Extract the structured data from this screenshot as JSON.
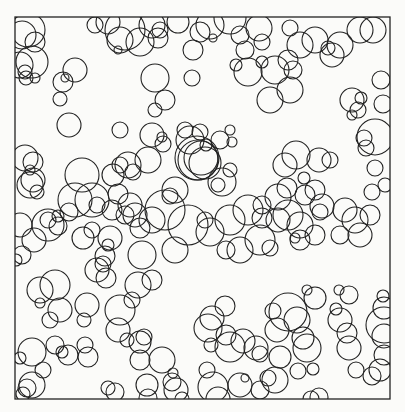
{
  "figure": {
    "frame": {
      "x": 15,
      "y": 17,
      "w": 375,
      "h": 382
    },
    "stroke_color": "#222222",
    "background": "#fbfbf9",
    "circles": [
      [
        22,
        35,
        14
      ],
      [
        28,
        30,
        17
      ],
      [
        35,
        42,
        10
      ],
      [
        20,
        65,
        13
      ],
      [
        32,
        62,
        16
      ],
      [
        26,
        78,
        7
      ],
      [
        35,
        78,
        5
      ],
      [
        95,
        25,
        8
      ],
      [
        108,
        22,
        12
      ],
      [
        125,
        30,
        20
      ],
      [
        120,
        40,
        13
      ],
      [
        118,
        50,
        4
      ],
      [
        140,
        42,
        14
      ],
      [
        158,
        38,
        10
      ],
      [
        152,
        25,
        13
      ],
      [
        160,
        30,
        8
      ],
      [
        178,
        22,
        11
      ],
      [
        200,
        32,
        10
      ],
      [
        193,
        50,
        10
      ],
      [
        155,
        78,
        14
      ],
      [
        165,
        100,
        10
      ],
      [
        75,
        70,
        12
      ],
      [
        63,
        82,
        10
      ],
      [
        65,
        78,
        4
      ],
      [
        60,
        99,
        7
      ],
      [
        25,
        72,
        7
      ],
      [
        33,
        180,
        12
      ],
      [
        25,
        158,
        13
      ],
      [
        33,
        162,
        10
      ],
      [
        30,
        185,
        13
      ],
      [
        37,
        192,
        7
      ],
      [
        30,
        170,
        5
      ],
      [
        69,
        125,
        12
      ],
      [
        155,
        110,
        7
      ],
      [
        192,
        78,
        8
      ],
      [
        213,
        38,
        4
      ],
      [
        210,
        25,
        14
      ],
      [
        230,
        18,
        16
      ],
      [
        240,
        35,
        9
      ],
      [
        259,
        28,
        13
      ],
      [
        245,
        50,
        9
      ],
      [
        262,
        42,
        8
      ],
      [
        236,
        65,
        6
      ],
      [
        248,
        72,
        14
      ],
      [
        262,
        62,
        6
      ],
      [
        275,
        70,
        14
      ],
      [
        290,
        90,
        13
      ],
      [
        270,
        100,
        13
      ],
      [
        293,
        70,
        9
      ],
      [
        288,
        60,
        10
      ],
      [
        290,
        28,
        8
      ],
      [
        300,
        45,
        13
      ],
      [
        315,
        40,
        13
      ],
      [
        328,
        48,
        7
      ],
      [
        340,
        45,
        13
      ],
      [
        332,
        55,
        12
      ],
      [
        360,
        30,
        13
      ],
      [
        373,
        30,
        13
      ],
      [
        381,
        80,
        9
      ],
      [
        352,
        100,
        12
      ],
      [
        358,
        110,
        8
      ],
      [
        361,
        98,
        6
      ],
      [
        352,
        115,
        5
      ],
      [
        383,
        104,
        9
      ],
      [
        375,
        137,
        18
      ],
      [
        364,
        138,
        8
      ],
      [
        366,
        148,
        8
      ],
      [
        375,
        168,
        8
      ],
      [
        330,
        160,
        8
      ],
      [
        319,
        160,
        12
      ],
      [
        296,
        155,
        14
      ],
      [
        285,
        165,
        12
      ],
      [
        304,
        178,
        6
      ],
      [
        305,
        195,
        10
      ],
      [
        287,
        188,
        10
      ],
      [
        278,
        197,
        13
      ],
      [
        278,
        220,
        12
      ],
      [
        288,
        215,
        15
      ],
      [
        315,
        190,
        10
      ],
      [
        322,
        206,
        12
      ],
      [
        320,
        212,
        8
      ],
      [
        345,
        210,
        12
      ],
      [
        355,
        220,
        13
      ],
      [
        370,
        215,
        10
      ],
      [
        385,
        185,
        7
      ],
      [
        372,
        192,
        8
      ],
      [
        300,
        225,
        13
      ],
      [
        315,
        235,
        10
      ],
      [
        300,
        240,
        10
      ],
      [
        295,
        238,
        5
      ],
      [
        340,
        235,
        9
      ],
      [
        360,
        235,
        12
      ],
      [
        230,
        220,
        15
      ],
      [
        248,
        210,
        15
      ],
      [
        262,
        205,
        9
      ],
      [
        262,
        218,
        10
      ],
      [
        260,
        240,
        15
      ],
      [
        270,
        248,
        8
      ],
      [
        240,
        250,
        13
      ],
      [
        226,
        250,
        9
      ],
      [
        197,
        158,
        22
      ],
      [
        198,
        160,
        20
      ],
      [
        205,
        163,
        16
      ],
      [
        201,
        158,
        17
      ],
      [
        190,
        140,
        14
      ],
      [
        220,
        140,
        9
      ],
      [
        232,
        142,
        5
      ],
      [
        230,
        130,
        5
      ],
      [
        206,
        145,
        6
      ],
      [
        185,
        130,
        8
      ],
      [
        200,
        132,
        8
      ],
      [
        218,
        185,
        7
      ],
      [
        230,
        170,
        7
      ],
      [
        222,
        182,
        14
      ],
      [
        175,
        190,
        13
      ],
      [
        170,
        196,
        8
      ],
      [
        165,
        210,
        20
      ],
      [
        152,
        220,
        13
      ],
      [
        130,
        205,
        12
      ],
      [
        125,
        215,
        9
      ],
      [
        135,
        215,
        12
      ],
      [
        140,
        228,
        10
      ],
      [
        142,
        255,
        14
      ],
      [
        152,
        280,
        10
      ],
      [
        112,
        210,
        10
      ],
      [
        110,
        238,
        12
      ],
      [
        108,
        245,
        6
      ],
      [
        105,
        256,
        10
      ],
      [
        103,
        264,
        8
      ],
      [
        97,
        270,
        12
      ],
      [
        92,
        200,
        17
      ],
      [
        75,
        200,
        17
      ],
      [
        69,
        212,
        9
      ],
      [
        58,
        226,
        9
      ],
      [
        58,
        216,
        6
      ],
      [
        48,
        225,
        16
      ],
      [
        48,
        220,
        8
      ],
      [
        34,
        240,
        12
      ],
      [
        20,
        225,
        12
      ],
      [
        16,
        260,
        6
      ],
      [
        22,
        255,
        9
      ],
      [
        40,
        290,
        13
      ],
      [
        83,
        238,
        11
      ],
      [
        92,
        230,
        8
      ],
      [
        97,
        205,
        8
      ],
      [
        82,
        175,
        17
      ],
      [
        113,
        175,
        11
      ],
      [
        120,
        165,
        8
      ],
      [
        128,
        165,
        13
      ],
      [
        133,
        172,
        8
      ],
      [
        148,
        160,
        13
      ],
      [
        118,
        194,
        10
      ],
      [
        162,
        137,
        5
      ],
      [
        163,
        144,
        8
      ],
      [
        120,
        130,
        8
      ],
      [
        152,
        135,
        12
      ],
      [
        175,
        250,
        13
      ],
      [
        188,
        225,
        20
      ],
      [
        205,
        220,
        8
      ],
      [
        210,
        232,
        14
      ],
      [
        132,
        300,
        8
      ],
      [
        138,
        285,
        13
      ],
      [
        212,
        318,
        12
      ],
      [
        225,
        306,
        10
      ],
      [
        226,
        335,
        10
      ],
      [
        230,
        347,
        15
      ],
      [
        208,
        328,
        14
      ],
      [
        211,
        345,
        7
      ],
      [
        243,
        341,
        12
      ],
      [
        256,
        348,
        12
      ],
      [
        273,
        311,
        8
      ],
      [
        277,
        330,
        12
      ],
      [
        260,
        354,
        8
      ],
      [
        280,
        357,
        11
      ],
      [
        268,
        378,
        8
      ],
      [
        275,
        380,
        13
      ],
      [
        240,
        385,
        12
      ],
      [
        245,
        378,
        4
      ],
      [
        213,
        387,
        15
      ],
      [
        207,
        370,
        8
      ],
      [
        172,
        382,
        9
      ],
      [
        176,
        390,
        12
      ],
      [
        173,
        373,
        5
      ],
      [
        147,
        385,
        11
      ],
      [
        140,
        360,
        10
      ],
      [
        162,
        360,
        13
      ],
      [
        140,
        342,
        11
      ],
      [
        144,
        337,
        8
      ],
      [
        120,
        310,
        15
      ],
      [
        118,
        330,
        12
      ],
      [
        127,
        340,
        7
      ],
      [
        87,
        305,
        12
      ],
      [
        84,
        320,
        7
      ],
      [
        106,
        278,
        10
      ],
      [
        55,
        285,
        15
      ],
      [
        60,
        310,
        12
      ],
      [
        50,
        320,
        8
      ],
      [
        40,
        303,
        5
      ],
      [
        32,
        352,
        14
      ],
      [
        20,
        358,
        6
      ],
      [
        55,
        345,
        9
      ],
      [
        68,
        355,
        10
      ],
      [
        62,
        352,
        6
      ],
      [
        85,
        345,
        8
      ],
      [
        88,
        357,
        10
      ],
      [
        43,
        370,
        8
      ],
      [
        32,
        385,
        13
      ],
      [
        27,
        388,
        9
      ],
      [
        23,
        394,
        7
      ],
      [
        108,
        388,
        7
      ],
      [
        115,
        392,
        9
      ],
      [
        148,
        398,
        9
      ],
      [
        182,
        399,
        7
      ],
      [
        218,
        399,
        12
      ],
      [
        260,
        390,
        9
      ],
      [
        288,
        312,
        19
      ],
      [
        297,
        320,
        13
      ],
      [
        303,
        338,
        11
      ],
      [
        307,
        348,
        14
      ],
      [
        336,
        309,
        6
      ],
      [
        340,
        320,
        12
      ],
      [
        347,
        333,
        10
      ],
      [
        349,
        348,
        12
      ],
      [
        356,
        370,
        8
      ],
      [
        298,
        371,
        8
      ],
      [
        313,
        369,
        6
      ],
      [
        311,
        399,
        8
      ],
      [
        319,
        397,
        9
      ],
      [
        315,
        298,
        11
      ],
      [
        307,
        290,
        5
      ],
      [
        349,
        295,
        9
      ],
      [
        339,
        290,
        5
      ],
      [
        383,
        296,
        6
      ],
      [
        384,
        308,
        11
      ],
      [
        384,
        325,
        18
      ],
      [
        384,
        336,
        12
      ],
      [
        384,
        355,
        10
      ],
      [
        372,
        376,
        9
      ],
      [
        380,
        370,
        11
      ]
    ]
  }
}
